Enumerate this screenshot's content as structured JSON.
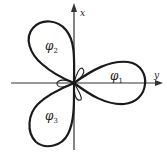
{
  "figure": {
    "axes": {
      "vertical_label": "x",
      "horizontal_label": "y"
    },
    "orbitals": [
      {
        "symbol": "φ",
        "subscript": "1",
        "direction": "along +y axis (right)"
      },
      {
        "symbol": "φ",
        "subscript": "2",
        "direction": "upper-left, 120° from φ1"
      },
      {
        "symbol": "φ",
        "subscript": "3",
        "direction": "lower-left, 240° from φ1"
      }
    ],
    "colors": {
      "line": "#1a1a1a",
      "axis": "#333333",
      "background": "#ffffff"
    }
  }
}
